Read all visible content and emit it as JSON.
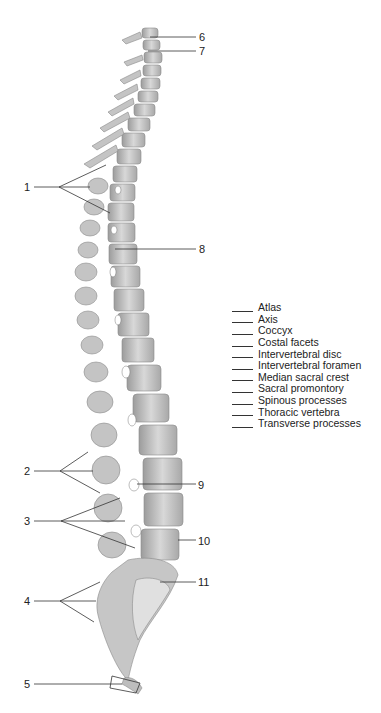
{
  "figure": {
    "callouts": [
      {
        "number": "1",
        "x": 24,
        "y": 181
      },
      {
        "number": "2",
        "x": 24,
        "y": 465
      },
      {
        "number": "3",
        "x": 24,
        "y": 515
      },
      {
        "number": "4",
        "x": 24,
        "y": 595
      },
      {
        "number": "5",
        "x": 24,
        "y": 678
      },
      {
        "number": "6",
        "x": 199,
        "y": 31
      },
      {
        "number": "7",
        "x": 199,
        "y": 45
      },
      {
        "number": "8",
        "x": 199,
        "y": 243
      },
      {
        "number": "9",
        "x": 198,
        "y": 479
      },
      {
        "number": "10",
        "x": 198,
        "y": 535
      },
      {
        "number": "11",
        "x": 198,
        "y": 576
      }
    ]
  },
  "legend": {
    "items": [
      "Atlas",
      "Axis",
      "Coccyx",
      "Costal facets",
      "Intervertebral disc",
      "Intervertebral foramen",
      "Median sacral crest",
      "Sacral promontory",
      "Spinous processes",
      "Thoracic vertebra",
      "Transverse processes"
    ]
  },
  "colors": {
    "bone": "#c9c9c9",
    "bone_shadow": "#9a9a9a",
    "bone_light": "#e6e6e6",
    "leader": "#333333"
  }
}
